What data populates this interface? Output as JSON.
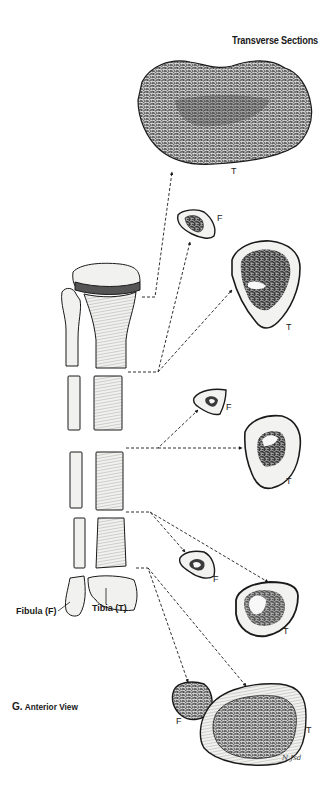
{
  "figure": {
    "title": "Transverse Sections",
    "caption_letter": "G.",
    "caption_text": "Anterior View",
    "bone_labels": {
      "fibula": "Fibula (F)",
      "tibia": "Tibia (T)"
    },
    "section_labels": [
      {
        "id": "s1-tibia",
        "text": "T"
      },
      {
        "id": "s2-fibula",
        "text": "F"
      },
      {
        "id": "s2-tibia",
        "text": "T"
      },
      {
        "id": "s3-fibula",
        "text": "F"
      },
      {
        "id": "s3-tibia",
        "text": "T"
      },
      {
        "id": "s4-fibula",
        "text": "F"
      },
      {
        "id": "s4-tibia",
        "text": "T"
      },
      {
        "id": "s5-fibula",
        "text": "F"
      },
      {
        "id": "s5-tibia",
        "text": "T"
      }
    ],
    "signature": "N Jsd",
    "colors": {
      "ink": "#1a1a1a",
      "bone_fill": "#f2f2f0",
      "cortex_fill": "#ececea",
      "spongy_dark": "#3a3a3a"
    }
  }
}
